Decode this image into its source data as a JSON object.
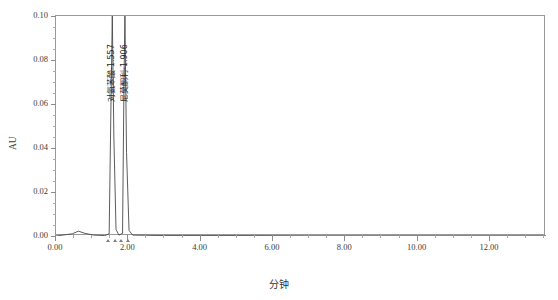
{
  "top_partial_text": "",
  "chart_data": {
    "type": "line",
    "title": "",
    "xlabel": "分钟",
    "ylabel": "AU",
    "xlim": [
      0.0,
      13.55
    ],
    "ylim": [
      0.0,
      0.1
    ],
    "grid": false,
    "legend_position": "none",
    "x_ticks": [
      0.0,
      2.0,
      4.0,
      6.0,
      8.0,
      10.0,
      12.0
    ],
    "x_tick_labels": [
      "0.00",
      "2.00",
      "4.00",
      "6.00",
      "8.00",
      "10.00",
      "12.00"
    ],
    "x_minor_step": 0.5,
    "y_ticks": [
      0.0,
      0.02,
      0.04,
      0.06,
      0.08,
      0.1
    ],
    "y_tick_labels": [
      "0.00",
      "0.02",
      "0.04",
      "0.06",
      "0.08",
      "0.10"
    ],
    "y_minor_step": 0.005,
    "series": [
      {
        "name": "detector-trace",
        "color": "#4a4a4a",
        "baseline": 0.0,
        "points": [
          {
            "x": 0.0,
            "y": 0.0
          },
          {
            "x": 0.45,
            "y": 0.001
          },
          {
            "x": 0.62,
            "y": 0.0022
          },
          {
            "x": 0.8,
            "y": 0.0012
          },
          {
            "x": 1.05,
            "y": 0.0004
          },
          {
            "x": 1.35,
            "y": 0.0002
          },
          {
            "x": 1.47,
            "y": 0.001
          },
          {
            "x": 1.52,
            "y": 0.06
          },
          {
            "x": 1.557,
            "y": 0.105
          },
          {
            "x": 1.6,
            "y": 0.045
          },
          {
            "x": 1.66,
            "y": 0.003
          },
          {
            "x": 1.74,
            "y": 0.0004
          },
          {
            "x": 1.84,
            "y": 0.0012
          },
          {
            "x": 1.88,
            "y": 0.07
          },
          {
            "x": 1.906,
            "y": 0.105
          },
          {
            "x": 1.95,
            "y": 0.038
          },
          {
            "x": 2.02,
            "y": 0.0025
          },
          {
            "x": 2.12,
            "y": 0.0004
          },
          {
            "x": 3.0,
            "y": 0.0002
          },
          {
            "x": 5.0,
            "y": 0.0002
          },
          {
            "x": 7.0,
            "y": 0.0001
          },
          {
            "x": 9.0,
            "y": 0.0001
          },
          {
            "x": 11.0,
            "y": 0.0001
          },
          {
            "x": 13.55,
            "y": 0.0001
          }
        ]
      }
    ],
    "peaks": [
      {
        "name": "对氨苯酸",
        "retention_time": "1.557",
        "label": "对氨苯酸-1.557",
        "x": 1.557
      },
      {
        "name": "尼莫酮利",
        "retention_time": "1.906",
        "label": "尼莫酮利-1.906",
        "x": 1.906
      }
    ],
    "integration_markers": [
      1.47,
      1.66,
      1.84,
      2.02
    ]
  }
}
